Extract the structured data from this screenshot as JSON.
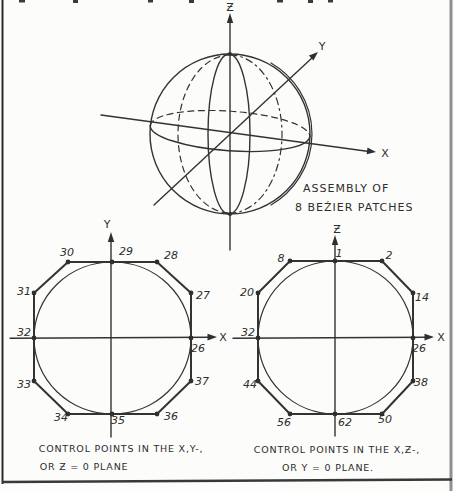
{
  "colors": {
    "ink": "#2f2f2f",
    "paper": "#fcfcfa",
    "border_right": "#909090"
  },
  "figure": {
    "sphere": {
      "axis_labels": {
        "x": "X",
        "y": "Y",
        "z": "Ƶ"
      },
      "caption": [
        "ASSEMBLY OF",
        "8 BEŹIER PATCHES"
      ]
    },
    "xy_diagram": {
      "axis_labels": {
        "x": "X",
        "y": "Y"
      },
      "point_labels": [
        "29",
        "28",
        "27",
        "26",
        "37",
        "36",
        "35",
        "34",
        "33",
        "32",
        "31",
        "30"
      ],
      "caption": [
        "CONTROL POINTS IN THE X,Y-,",
        "OR Ƶ = 0 PLANE"
      ]
    },
    "xz_diagram": {
      "axis_labels": {
        "x": "X",
        "z": "Ƶ"
      },
      "point_labels": [
        "1",
        "2",
        "14",
        "26",
        "38",
        "50",
        "62",
        "56",
        "44",
        "32",
        "20",
        "8"
      ],
      "caption": [
        "CONTROL POINTS IN THE X,Ƶ-,",
        "OR Y = 0 PLANE."
      ]
    }
  }
}
